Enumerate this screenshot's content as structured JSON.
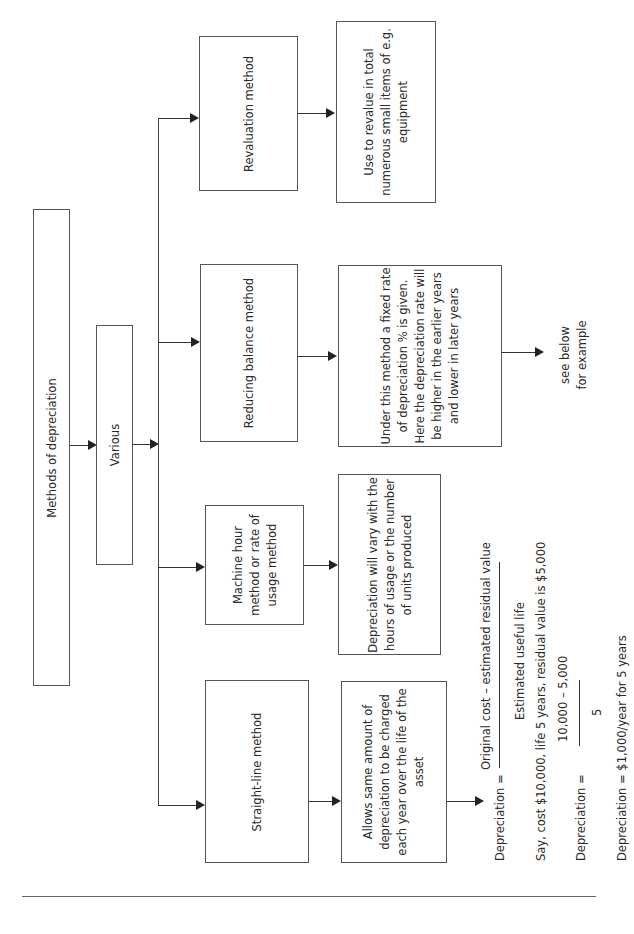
{
  "diagram": {
    "root": {
      "label": "Methods of depreciation"
    },
    "various": {
      "label": "Various"
    },
    "methods": [
      {
        "id": "revaluation",
        "label_lines": [
          "Revaluation method"
        ],
        "description_lines": [
          "Use to revalue in total",
          "numerous small items of e.g.",
          "equipment"
        ]
      },
      {
        "id": "reducing-balance",
        "label_lines": [
          "Reducing balance method"
        ],
        "description_lines": [
          "Under this method a fixed rate",
          "of depreciation % is given.",
          "Here the depreciation rate will",
          "be higher in the earlier years",
          "and lower in later years"
        ],
        "note_lines": [
          "see below",
          "for example"
        ]
      },
      {
        "id": "machine-hour",
        "label_lines": [
          "Machine hour",
          "method or rate of",
          "usage method"
        ],
        "description_lines": [
          "Depreciation will vary with the",
          "hours of usage or the number",
          "of units produced"
        ]
      },
      {
        "id": "straight-line",
        "label_lines": [
          "Straight-line method"
        ],
        "description_lines": [
          "Allows same amount of",
          "depreciation to be charged",
          "each year over the life of the",
          "asset"
        ]
      }
    ],
    "formula": {
      "lhs": "Depreciation =",
      "numerator": "Original cost – estimated residual value",
      "denominator": "Estimated useful life",
      "example_intro": "Say, cost $10,000, life 5 years, residual value is $5,000",
      "example_lhs": "Depreciation =",
      "example_numerator": "10,000 – 5,000",
      "example_denominator": "5",
      "result": "Depreciation = $1,000/year for 5 years"
    }
  }
}
